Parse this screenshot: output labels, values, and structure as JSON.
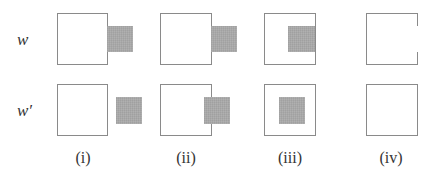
{
  "rows": [
    {
      "label": "w"
    },
    {
      "label": "w′"
    }
  ],
  "columns": [
    {
      "label": "(i)"
    },
    {
      "label": "(ii)"
    },
    {
      "label": "(iii)"
    },
    {
      "label": "(iv)"
    }
  ],
  "panels": {
    "w_i": {
      "description": "outline square with gray square attached outside, adjacent to right edge"
    },
    "w_ii": {
      "description": "outline square with gray square attached outside, adjacent to right edge"
    },
    "w_iii": {
      "description": "outline square with gray square inside, flush with right edge"
    },
    "w_iv": {
      "description": "outline square with gap in the right edge"
    },
    "wp_i": {
      "description": "outline square with separate gray square to the right"
    },
    "wp_ii": {
      "description": "outline square with gray square overlapping right edge"
    },
    "wp_iii": {
      "description": "outline square with gray square centered inside"
    },
    "wp_iv": {
      "description": "plain outline square"
    }
  },
  "colors": {
    "outline": "#8a8a8a",
    "fill": "#a9a9a9",
    "background": "#ffffff"
  }
}
